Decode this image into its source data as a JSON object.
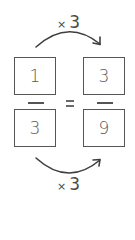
{
  "colors": {
    "stroke": "#555555",
    "text": "#5a5a5a",
    "background": "#ffffff"
  },
  "left_fraction": {
    "numerator": "1",
    "denominator": "3"
  },
  "right_fraction": {
    "numerator": "3",
    "denominator": "9"
  },
  "equals_sign": "=",
  "top_arrow": {
    "operator": "×",
    "factor": "3",
    "icon": "curved-arrow-right-icon"
  },
  "bottom_arrow": {
    "operator": "×",
    "factor": "3",
    "icon": "curved-arrow-right-icon"
  }
}
